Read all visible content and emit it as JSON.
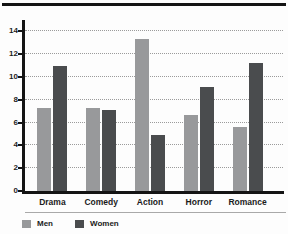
{
  "chart_data": {
    "type": "bar",
    "title": "",
    "categories": [
      "Drama",
      "Comedy",
      "Action",
      "Horror",
      "Romance"
    ],
    "series": [
      {
        "name": "Men",
        "color": "#98999b",
        "values": [
          7.3,
          7.3,
          13.3,
          6.7,
          5.6
        ]
      },
      {
        "name": "Women",
        "color": "#4a4c4e",
        "values": [
          11.0,
          7.1,
          4.9,
          9.1,
          11.2
        ]
      }
    ],
    "xlabel": "",
    "ylabel": "",
    "ylim": [
      0,
      15
    ],
    "yticks": [
      0,
      2,
      4,
      6,
      8,
      10,
      12,
      14
    ],
    "grid": "horizontal-dotted",
    "legend_position": "bottom-left",
    "axis_color": "#141414",
    "gridline_color": "#9b9b9b"
  }
}
